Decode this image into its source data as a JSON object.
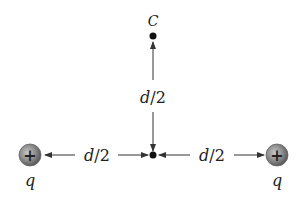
{
  "diagram": {
    "point_label": "C",
    "charges": [
      {
        "sign": "+",
        "label": "q",
        "position": "left"
      },
      {
        "sign": "+",
        "label": "q",
        "position": "right"
      }
    ],
    "distances": {
      "vertical": {
        "var": "d",
        "rest": "/2"
      },
      "left": {
        "var": "d",
        "rest": "/2"
      },
      "right": {
        "var": "d",
        "rest": "/2"
      }
    },
    "colors": {
      "line": "#333333",
      "charge_fill": "#8a8a8a",
      "dot": "#111111"
    }
  }
}
